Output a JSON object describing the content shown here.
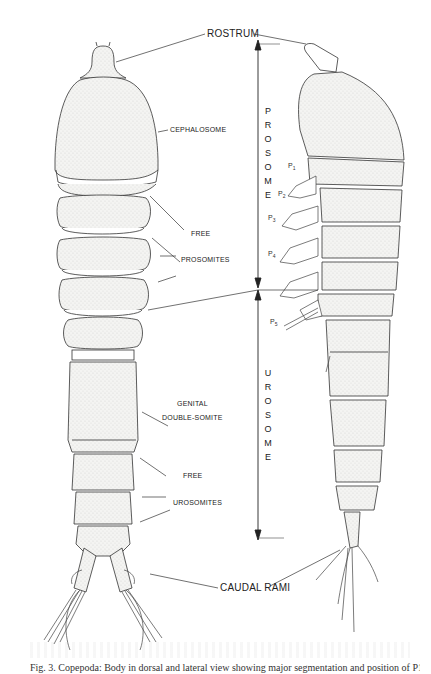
{
  "figure": {
    "labels": {
      "rostrum": "ROSTRUM",
      "cephalosome": "CEPHALOSOME",
      "free_1": "FREE",
      "prosomites": "PROSOMITES",
      "genital": "GENITAL",
      "double_somite": "DOUBLE-SOMITE",
      "free_2": "FREE",
      "urosomites": "UROSOMITES",
      "caudal_rami": "CAUDAL  RAMI"
    },
    "regions": {
      "prosome": [
        "P",
        "R",
        "O",
        "S",
        "O",
        "M",
        "E"
      ],
      "urosome": [
        "U",
        "R",
        "O",
        "S",
        "O",
        "M",
        "E"
      ]
    },
    "legs": [
      {
        "label": "P",
        "sub": "1"
      },
      {
        "label": "P",
        "sub": "2"
      },
      {
        "label": "P",
        "sub": "3"
      },
      {
        "label": "P",
        "sub": "4"
      },
      {
        "label": "P",
        "sub": "5"
      }
    ],
    "views": [
      "dorsal",
      "lateral"
    ]
  },
  "caption": {
    "text": "Fig. 3. Copepoda: Body in dorsal and lateral view showing major segmentation and position of P1–P5"
  }
}
